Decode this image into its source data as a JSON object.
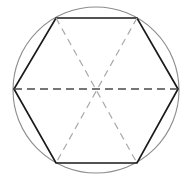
{
  "figure": {
    "title": "Regular hexagon inscribed in a circle with three main diagonals",
    "type": "geometric-diagram",
    "canvas": {
      "width": 185,
      "height": 184,
      "background_color": "#ffffff"
    },
    "circle": {
      "name": "circumscribed-circle",
      "center_x": 96,
      "center_y": 90,
      "radius": 83,
      "stroke_color": "#8c8c8c",
      "stroke_width": 1.1,
      "fill": "none",
      "style": "solid"
    },
    "hexagon": {
      "name": "inscribed-hexagon",
      "sides": 6,
      "stroke_color": "#1a1a1a",
      "stroke_width": 1.7,
      "fill": "none",
      "style": "solid",
      "vertices": [
        {
          "label": "right",
          "x": 178,
          "y": 89
        },
        {
          "label": "top-right",
          "x": 137,
          "y": 18
        },
        {
          "label": "top-left",
          "x": 56,
          "y": 18
        },
        {
          "label": "left",
          "x": 14,
          "y": 89
        },
        {
          "label": "bottom-left",
          "x": 56,
          "y": 163
        },
        {
          "label": "bottom-right",
          "x": 137,
          "y": 163
        }
      ]
    },
    "diagonals": {
      "name": "main-diagonals",
      "count": 3,
      "style": "dashed",
      "dash_pattern": "7 5",
      "items": [
        {
          "label": "horizontal-diagonal",
          "from": "left",
          "to": "right",
          "x1": 14,
          "y1": 89,
          "x2": 178,
          "y2": 89,
          "stroke_color": "#4a4a4a",
          "stroke_width": 1.3,
          "dash_pattern": "8 5"
        },
        {
          "label": "top-left-to-bottom-right-diagonal",
          "from": "top-left",
          "to": "bottom-right",
          "x1": 56,
          "y1": 18,
          "x2": 137,
          "y2": 163,
          "stroke_color": "#a8a8a8",
          "stroke_width": 1.2,
          "dash_pattern": "7 5"
        },
        {
          "label": "top-right-to-bottom-left-diagonal",
          "from": "top-right",
          "to": "bottom-left",
          "x1": 137,
          "y1": 18,
          "x2": 56,
          "y2": 163,
          "stroke_color": "#a8a8a8",
          "stroke_width": 1.2,
          "dash_pattern": "7 5"
        }
      ]
    },
    "center_point": {
      "name": "hexagon-center",
      "x": 96,
      "y": 90,
      "visible": false
    },
    "labels": []
  }
}
